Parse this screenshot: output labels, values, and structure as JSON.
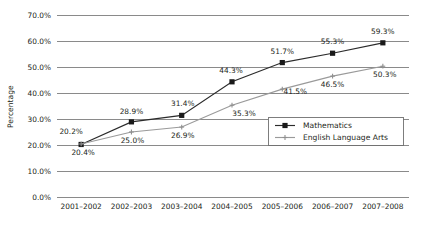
{
  "chart_data": {
    "type": "line",
    "title": "",
    "xlabel": "",
    "ylabel": "Percentage",
    "ylim": [
      0,
      70
    ],
    "ytick_step": 10,
    "grid": true,
    "legend_position": "inside-right",
    "categories": [
      "2001–2002",
      "2002–2003",
      "2003–2004",
      "2004–2005",
      "2005–2006",
      "2006–2007",
      "2007–2008"
    ],
    "ytick_labels": [
      "0.0%",
      "10.0%",
      "20.0%",
      "30.0%",
      "40.0%",
      "50.0%",
      "60.0%",
      "70.0%"
    ],
    "ytick_values": [
      0,
      10,
      20,
      30,
      40,
      50,
      60,
      70
    ],
    "series": [
      {
        "name": "Mathematics",
        "marker": "square",
        "color": "#2b2b2b",
        "values": [
          20.2,
          28.9,
          31.4,
          44.3,
          51.7,
          55.3,
          59.3
        ],
        "labels": [
          "20.2%",
          "28.9%",
          "31.4%",
          "44.3%",
          "51.7%",
          "55.3%",
          "59.3%"
        ],
        "label_dx": [
          -10,
          0,
          1,
          -1,
          0,
          0,
          0
        ],
        "label_dy": [
          -10,
          -8,
          -9,
          -9,
          -9,
          -9,
          -9
        ]
      },
      {
        "name": "English Language Arts",
        "marker": "cross",
        "color": "#9a9a9a",
        "values": [
          20.4,
          25.0,
          26.9,
          35.3,
          41.5,
          46.5,
          50.3
        ],
        "labels": [
          "20.4%",
          "25.0%",
          "26.9%",
          "35.3%",
          "41.5%",
          "46.5%",
          "50.3%"
        ],
        "label_dx": [
          2,
          1,
          1,
          12,
          13,
          0,
          2
        ],
        "label_dy": [
          11,
          11,
          11,
          11,
          5,
          11,
          11
        ]
      }
    ]
  },
  "legend": {
    "entries": [
      {
        "label": "Mathematics"
      },
      {
        "label": "English Language Arts"
      }
    ]
  }
}
